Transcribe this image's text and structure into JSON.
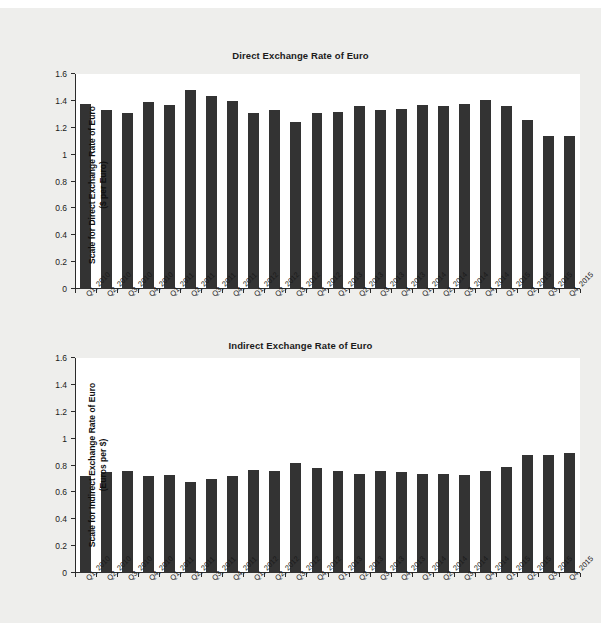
{
  "page": {
    "background_color": "#eeeeec",
    "plot_background_color": "#ffffff",
    "bar_color": "#333333",
    "axis_color": "#2b2b2b"
  },
  "charts": [
    {
      "id": "direct",
      "title": "Direct Exchange Rate of Euro",
      "ylabel_line1": "Scale for Direct Exchange Rate of Euro",
      "ylabel_line2": "($ per Euro)"
    },
    {
      "id": "indirect",
      "title": "Indirect Exchange Rate of Euro",
      "ylabel_line1": "Scale for Indirect Exchange Rate of Euro",
      "ylabel_line2": "(Euros per $)"
    }
  ],
  "chart_data": [
    {
      "type": "bar",
      "title": "Direct Exchange Rate of Euro",
      "xlabel": "",
      "ylabel": "Scale for Direct Exchange Rate of Euro ($ per Euro)",
      "ylim": [
        0,
        1.6
      ],
      "yticks": [
        0,
        0.2,
        0.4,
        0.6,
        0.8,
        1,
        1.2,
        1.4,
        1.6
      ],
      "ytick_labels": [
        "0",
        "0.2",
        "0.4",
        "0.6",
        "0.8",
        "1",
        "1.2",
        "1.4",
        "1.6"
      ],
      "grid": false,
      "legend": false,
      "categories": [
        "Q1, 2010",
        "Q2, 2010",
        "Q3, 2010",
        "Q4, 2010",
        "Q1, 2011",
        "Q2, 2011",
        "Q3, 2011",
        "Q4, 2011",
        "Q1, 2012",
        "Q2, 2012",
        "Q3, 2012",
        "Q4, 2012",
        "Q1, 2013",
        "Q2, 2013",
        "Q3, 2013",
        "Q4, 2013",
        "Q1, 2014",
        "Q2, 2014",
        "Q3, 2014",
        "Q4, 2014",
        "Q1, 2015",
        "Q2, 2015",
        "Q3, 2015",
        "Q4, 2015"
      ],
      "values": [
        1.38,
        1.33,
        1.31,
        1.39,
        1.37,
        1.48,
        1.44,
        1.4,
        1.31,
        1.33,
        1.24,
        1.31,
        1.32,
        1.36,
        1.33,
        1.34,
        1.37,
        1.36,
        1.38,
        1.41,
        1.36,
        1.26,
        1.14,
        1.14,
        1.12,
        1.12
      ]
    },
    {
      "type": "bar",
      "title": "Indirect Exchange Rate of Euro",
      "xlabel": "",
      "ylabel": "Scale for Indirect Exchange Rate of Euro (Euros per $)",
      "ylim": [
        0,
        1.6
      ],
      "yticks": [
        0,
        0.2,
        0.4,
        0.6,
        0.8,
        1,
        1.2,
        1.4,
        1.6
      ],
      "ytick_labels": [
        "0",
        "0.2",
        "0.4",
        "0.6",
        "0.8",
        "1",
        "1.2",
        "1.4",
        "1.6"
      ],
      "grid": false,
      "legend": false,
      "categories": [
        "Q1, 2010",
        "Q2, 2010",
        "Q3, 2010",
        "Q4, 2010",
        "Q1, 2011",
        "Q2, 2011",
        "Q3, 2011",
        "Q4, 2011",
        "Q1, 2012",
        "Q2, 2012",
        "Q3, 2012",
        "Q4, 2012",
        "Q1, 2013",
        "Q2, 2013",
        "Q3, 2013",
        "Q4, 2013",
        "Q1, 2014",
        "Q2, 2014",
        "Q3, 2014",
        "Q4, 2014",
        "Q1, 2015",
        "Q2, 2015",
        "Q3, 2015",
        "Q4, 2015"
      ],
      "values": [
        0.72,
        0.75,
        0.76,
        0.72,
        0.73,
        0.68,
        0.7,
        0.72,
        0.77,
        0.76,
        0.82,
        0.78,
        0.76,
        0.74,
        0.76,
        0.75,
        0.74,
        0.74,
        0.73,
        0.76,
        0.79,
        0.88,
        0.88,
        0.89,
        0.89,
        0.9
      ]
    }
  ]
}
